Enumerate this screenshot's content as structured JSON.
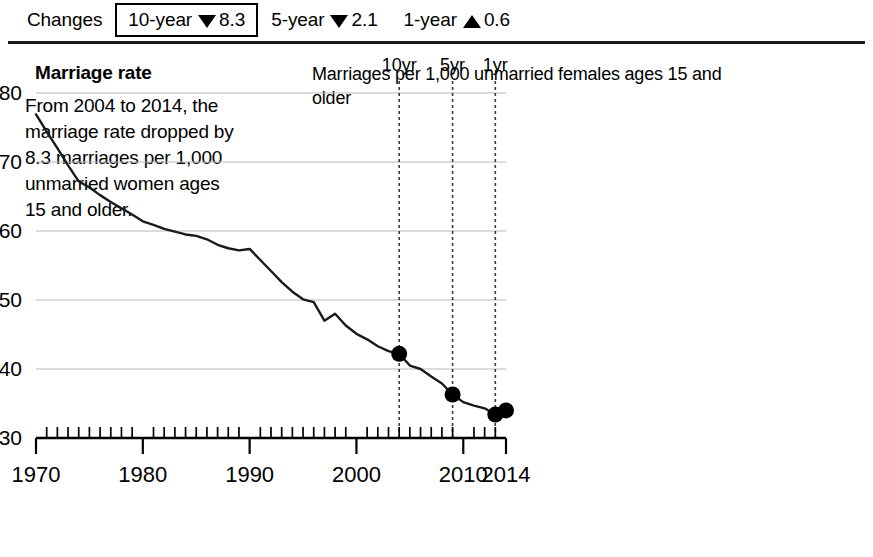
{
  "changes_bar": {
    "label": "Changes",
    "items": [
      {
        "period": "10-year",
        "direction": "down",
        "value": "8.3",
        "selected": true
      },
      {
        "period": "5-year",
        "direction": "down",
        "value": "2.1",
        "selected": false
      },
      {
        "period": "1-year",
        "direction": "up",
        "value": "0.6",
        "selected": false
      }
    ]
  },
  "left_panel": {
    "title": "Marriage rate",
    "body": "From 2004 to 2014, the marriage rate dropped by 8.3 marriages per 1,000 unmarried women ages 15 and older."
  },
  "chart_data": {
    "type": "line",
    "title": "Marriages per 1,000 unmarried females ages 15 and older",
    "xlabel": "",
    "ylabel": "",
    "grid": true,
    "legend": "none",
    "xlim": [
      1970,
      2014
    ],
    "ylim": [
      30,
      80
    ],
    "yticks": [
      30,
      40,
      50,
      60,
      70,
      80
    ],
    "ytick_labels": [
      "30",
      "40",
      "50",
      "60",
      "70",
      "80"
    ],
    "xticks": [
      1970,
      1980,
      1990,
      2000,
      2010,
      2014
    ],
    "xtick_labels": [
      "1970",
      "1980",
      "1990",
      "2000",
      "2010",
      "2014"
    ],
    "minor_xtick_interval": 1,
    "x": [
      1970,
      1971,
      1972,
      1973,
      1974,
      1975,
      1976,
      1977,
      1978,
      1979,
      1980,
      1981,
      1982,
      1983,
      1984,
      1985,
      1986,
      1987,
      1988,
      1989,
      1990,
      1991,
      1992,
      1993,
      1994,
      1995,
      1996,
      1997,
      1998,
      1999,
      2000,
      2001,
      2002,
      2003,
      2004,
      2005,
      2006,
      2007,
      2008,
      2009,
      2010,
      2011,
      2012,
      2013,
      2014
    ],
    "series": [
      {
        "name": "Marriage rate",
        "values": [
          76.9,
          74.4,
          72.0,
          69.5,
          67.2,
          66.3,
          65.2,
          64.2,
          63.3,
          62.4,
          61.4,
          60.9,
          60.3,
          59.9,
          59.5,
          59.3,
          58.8,
          58.0,
          57.5,
          57.2,
          57.4,
          55.8,
          54.2,
          52.6,
          51.2,
          50.1,
          49.7,
          47.0,
          48.0,
          46.3,
          45.1,
          44.3,
          43.3,
          42.6,
          42.2,
          40.5,
          40.0,
          38.9,
          37.9,
          36.3,
          35.2,
          34.7,
          34.3,
          33.4,
          34.0
        ]
      }
    ],
    "markers": [
      {
        "x": 2004,
        "y": 42.2
      },
      {
        "x": 2009,
        "y": 36.3
      },
      {
        "x": 2013,
        "y": 33.4
      },
      {
        "x": 2014,
        "y": 34.0
      }
    ],
    "reference_lines": [
      {
        "x": 2004,
        "label": "10yr"
      },
      {
        "x": 2009,
        "label": "5yr"
      },
      {
        "x": 2013,
        "label": "1yr"
      }
    ]
  }
}
